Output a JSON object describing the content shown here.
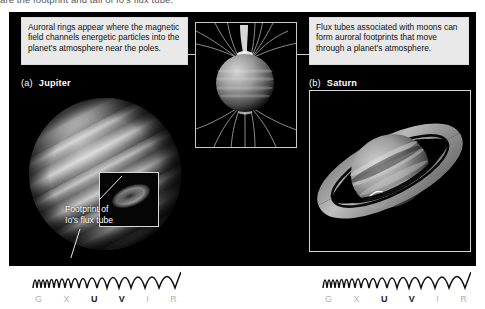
{
  "figure": {
    "caption_top": "are the footprint and tail of Io's flux tube.",
    "callout_left": "Auroral rings appear where the magnetic field channels energetic particles into the planet's atmosphere near the poles.",
    "callout_right": "Flux tubes associated with moons can form auroral footprints that move through a planet's atmosphere.",
    "background_color": "#000000",
    "callout_bg_color": "#e9e9e9"
  },
  "panels": [
    {
      "letter": "(a)",
      "name": "Jupiter",
      "annotation": "Footprint of",
      "annotation_line2": "Io's flux tube"
    },
    {
      "letter": "(b)",
      "name": "Saturn"
    }
  ],
  "spectrum": {
    "letters": [
      "G",
      "X",
      "U",
      "V",
      "I",
      "R"
    ],
    "highlighted": [
      "U",
      "V"
    ],
    "active_color": "#1a1a1a",
    "inactive_color": "#b2b2b2"
  }
}
